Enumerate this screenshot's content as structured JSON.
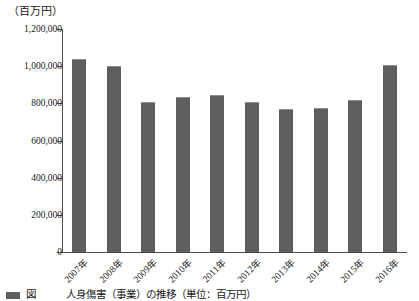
{
  "figure": {
    "unit_label": "（百万円）",
    "caption": "図　　　人身傷害（事業）の推移（単位：百万円）"
  },
  "chart_data": {
    "type": "bar",
    "title": "",
    "subtitle": "",
    "xlabel": "",
    "ylabel": "（百万円）",
    "categories": [
      "2007年",
      "2008年",
      "2009年",
      "2010年",
      "2011年",
      "2012年",
      "2013年",
      "2014年",
      "2015年",
      "2016年"
    ],
    "values": [
      1040000,
      1000000,
      805000,
      832000,
      845000,
      805000,
      770000,
      775000,
      818000,
      1008000
    ],
    "series": [
      {
        "name": "金額",
        "values": [
          1040000,
          1000000,
          805000,
          832000,
          845000,
          805000,
          770000,
          775000,
          818000,
          1008000
        ]
      }
    ],
    "ylim": [
      0,
      1200000
    ],
    "ytick_values": [
      0,
      200000,
      400000,
      600000,
      800000,
      1000000,
      1200000
    ],
    "ytick_labels": [
      "0",
      "200,000",
      "400,000",
      "600,000",
      "800,000",
      "1,000,000",
      "1,200,000"
    ],
    "grid": false,
    "legend": "none",
    "bar_color": "#5e5e5e",
    "axis_color": "#4a4a4a",
    "background_color": "#ffffff"
  }
}
